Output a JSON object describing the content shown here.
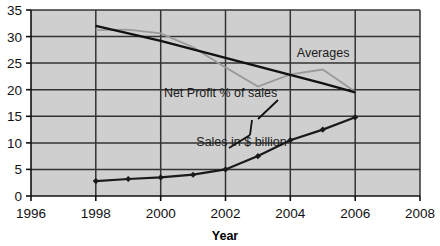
{
  "chart_data": {
    "type": "line",
    "title": "",
    "xlabel": "Year",
    "ylabel": "",
    "xlim": [
      1996,
      2008
    ],
    "ylim": [
      0,
      35
    ],
    "grid": true,
    "legend_position": "none",
    "plot_background": "#cfcfcf",
    "x_ticks": [
      "1996",
      "1998",
      "2000",
      "2002",
      "2004",
      "2006",
      "2008"
    ],
    "y_ticks": [
      "0",
      "5",
      "10",
      "15",
      "20",
      "25",
      "30",
      "35"
    ],
    "x": [
      1998,
      1999,
      2000,
      2001,
      2002,
      2003,
      2004,
      2005,
      2006
    ],
    "series": [
      {
        "name": "Sales in $ billion",
        "color": "#1a1a1a",
        "marker": "diamond",
        "values": [
          2.8,
          3.2,
          3.5,
          4.0,
          5.0,
          7.5,
          10.5,
          12.5,
          14.8
        ]
      },
      {
        "name": "Net Profit % of sales",
        "color": "#111111",
        "marker": "none",
        "values": [
          32.0,
          30.6,
          29.2,
          27.6,
          26.0,
          24.4,
          22.8,
          21.2,
          19.5
        ]
      },
      {
        "name": "Averages",
        "color": "#9a9a9a",
        "marker": "none",
        "values": [
          31.2,
          31.3,
          30.6,
          28.0,
          24.2,
          20.6,
          22.9,
          23.8,
          19.6
        ]
      }
    ],
    "annotations": [
      {
        "text": "Averages",
        "x": 2004.2,
        "y": 26.2
      },
      {
        "text": "Net Profit % of sales",
        "x": 2000.1,
        "y": 18.6
      },
      {
        "text": "Sales in $ billion",
        "x": 2001.1,
        "y": 9.4
      }
    ]
  }
}
